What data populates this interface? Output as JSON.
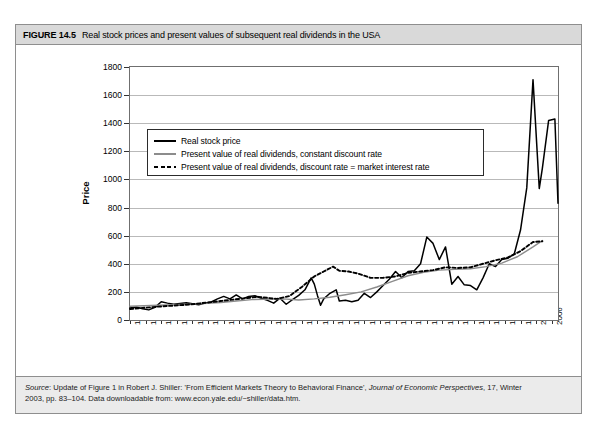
{
  "scan_artifact": "",
  "figure": {
    "number": "FIGURE 14.5",
    "caption": "Real stock prices and present values of subsequent real dividends in the USA",
    "source_prefix": "Source",
    "source_line1_a": ": Update of Figure 1 in Robert J. Shiller: 'From Efficient Markets Theory to Behavioral Finance', ",
    "source_journal": "Journal of Economic Perspectives",
    "source_line1_b": ", 17, Winter",
    "source_line2": "2003, pp. 83–104. Data downloadable from: www.econ.yale.edu/~shiller/data.htm."
  },
  "legend": {
    "items": [
      {
        "label": "Real stock price",
        "style": "solid-black"
      },
      {
        "label": "Present value of real dividends, constant discount rate",
        "style": "solid-gray"
      },
      {
        "label": "Present value of real dividends, discount rate = market interest rate",
        "style": "dotted-black"
      }
    ]
  },
  "colors": {
    "stock_price": "#000000",
    "pv_constant": "#8c8c8c",
    "pv_market": "#000000",
    "gridline": "#b9b9b9",
    "frame": "#6f6f6f",
    "header_bg": "#d9d9d9",
    "source_bg": "#ebebeb"
  },
  "chart_data": {
    "type": "line",
    "title": "Real stock prices and present values of subsequent real dividends in the USA",
    "xlabel": "",
    "ylabel": "Price",
    "xlim": [
      1871,
      2008
    ],
    "ylim": [
      0,
      1800
    ],
    "yticks": [
      0,
      200,
      400,
      600,
      800,
      1000,
      1200,
      1400,
      1600,
      1800
    ],
    "xticks": [
      1871,
      1876,
      1881,
      1886,
      1891,
      1896,
      1901,
      1906,
      1911,
      1916,
      1921,
      1926,
      1931,
      1936,
      1941,
      1946,
      1951,
      1956,
      1961,
      1966,
      1971,
      1976,
      1981,
      1986,
      1991,
      1996,
      2001,
      2006
    ],
    "grid": true,
    "legend_position": "upper-left-inside",
    "series": [
      {
        "name": "Real stock price",
        "style": "solid",
        "color": "#000000",
        "x": [
          1871,
          1873,
          1875,
          1877,
          1879,
          1881,
          1883,
          1885,
          1887,
          1889,
          1891,
          1893,
          1895,
          1897,
          1899,
          1901,
          1903,
          1905,
          1907,
          1909,
          1911,
          1913,
          1915,
          1917,
          1919,
          1921,
          1923,
          1925,
          1927,
          1929,
          1930,
          1931,
          1932,
          1933,
          1935,
          1937,
          1938,
          1940,
          1942,
          1944,
          1946,
          1948,
          1950,
          1952,
          1954,
          1956,
          1958,
          1960,
          1962,
          1964,
          1966,
          1968,
          1970,
          1972,
          1974,
          1976,
          1978,
          1980,
          1982,
          1984,
          1986,
          1988,
          1990,
          1992,
          1994,
          1996,
          1998,
          2000,
          2002,
          2003,
          2005,
          2007,
          2008
        ],
        "y": [
          85,
          92,
          80,
          72,
          90,
          130,
          120,
          112,
          118,
          122,
          115,
          108,
          120,
          128,
          150,
          168,
          150,
          178,
          150,
          168,
          172,
          155,
          140,
          120,
          155,
          112,
          145,
          175,
          215,
          300,
          255,
          175,
          105,
          150,
          190,
          215,
          135,
          140,
          130,
          140,
          190,
          160,
          200,
          245,
          290,
          345,
          300,
          345,
          350,
          400,
          590,
          545,
          430,
          520,
          255,
          310,
          250,
          245,
          215,
          300,
          400,
          380,
          430,
          440,
          470,
          640,
          940,
          1710,
          935,
          1080,
          1420,
          1430,
          830
        ]
      },
      {
        "name": "Present value of real dividends, constant discount rate",
        "style": "solid",
        "color": "#8c8c8c",
        "x": [
          1871,
          1880,
          1890,
          1900,
          1910,
          1920,
          1925,
          1930,
          1935,
          1940,
          1945,
          1950,
          1955,
          1960,
          1965,
          1970,
          1975,
          1980,
          1985,
          1990,
          1995,
          2000,
          2003
        ],
        "y": [
          98,
          105,
          112,
          125,
          145,
          150,
          142,
          150,
          162,
          180,
          200,
          235,
          275,
          315,
          340,
          355,
          360,
          365,
          380,
          405,
          450,
          520,
          565
        ]
      },
      {
        "name": "Present value of real dividends, discount rate = market interest rate",
        "style": "dotted",
        "color": "#000000",
        "x": [
          1871,
          1880,
          1890,
          1900,
          1906,
          1912,
          1918,
          1922,
          1926,
          1930,
          1933,
          1936,
          1938,
          1941,
          1944,
          1948,
          1952,
          1956,
          1960,
          1964,
          1968,
          1972,
          1976,
          1980,
          1984,
          1988,
          1992,
          1996,
          2000,
          2003
        ],
        "y": [
          78,
          95,
          110,
          135,
          150,
          165,
          150,
          170,
          235,
          310,
          345,
          380,
          350,
          345,
          330,
          300,
          300,
          310,
          335,
          345,
          355,
          375,
          370,
          375,
          400,
          425,
          445,
          490,
          555,
          560
        ]
      }
    ]
  }
}
